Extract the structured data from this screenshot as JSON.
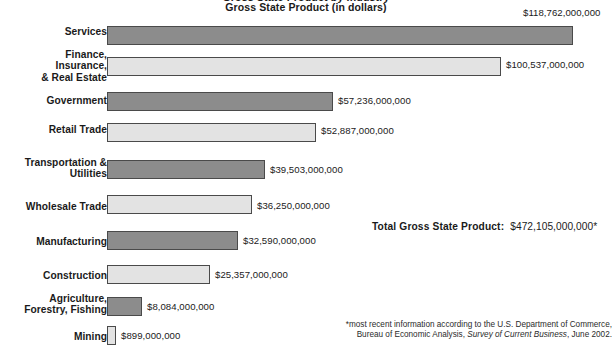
{
  "header": {
    "title_clipped": "Gross State Product by Industry",
    "subtitle": "Gross State Product (in dollars)"
  },
  "total": {
    "label": "Total Gross State Product:",
    "value": "$472,105,000,000*"
  },
  "footnote": {
    "line1": "*most recent information according to the U.S. Department of Commerce,",
    "line2_pre": "Bureau of Economic Analysis, ",
    "line2_ital": "Survey of Current Business",
    "line2_post": ", June 2002."
  },
  "chart_data": {
    "type": "bar",
    "orientation": "horizontal",
    "title": "Gross State Product by Industry",
    "subtitle": "Gross State Product (in dollars)",
    "xlabel": "",
    "ylabel": "",
    "grid": false,
    "legend": "none",
    "xlim": [
      0,
      118762000000
    ],
    "categories": [
      "Services",
      "Finance, Insurance, & Real Estate",
      "Government",
      "Retail Trade",
      "Transportation & Utilities",
      "Wholesale Trade",
      "Manufacturing",
      "Construction",
      "Agriculture, Forestry, Fishing",
      "Mining"
    ],
    "values": [
      118762000000,
      100537000000,
      57236000000,
      52887000000,
      39503000000,
      36250000000,
      32590000000,
      25357000000,
      8084000000,
      899000000
    ],
    "value_labels": [
      "$118,762,000,000",
      "$100,537,000,000",
      "$57,236,000,000",
      "$52,887,000,000",
      "$39,503,000,000",
      "$36,250,000,000",
      "$32,590,000,000",
      "$25,357,000,000",
      "$8,084,000,000",
      "$899,000,000"
    ],
    "bar_colors": [
      "#8c8c8c",
      "#e3e3e3",
      "#8c8c8c",
      "#e3e3e3",
      "#8c8c8c",
      "#e3e3e3",
      "#8c8c8c",
      "#e3e3e3",
      "#8c8c8c",
      "#e3e3e3"
    ],
    "total_label": "Total Gross State Product:",
    "total_value": "$472,105,000,000*",
    "annotations": [
      "*most recent information according to the U.S. Department of Commerce, Bureau of Economic Analysis, Survey of Current Business, June 2002."
    ]
  },
  "rows": [
    {
      "label": "Services",
      "label_top": 26,
      "bar_top": 26,
      "bar_h": 19,
      "bar_w": 466,
      "value_top": 7,
      "value_left": 523,
      "shade": "dark"
    },
    {
      "label": "Finance,\nInsurance,\n& Real Estate",
      "label_top": 49,
      "bar_top": 57,
      "bar_h": 19,
      "bar_w": 394,
      "value_top": 59,
      "value_left": 506,
      "shade": "light"
    },
    {
      "label": "Government",
      "label_top": 95,
      "bar_top": 92,
      "bar_h": 19,
      "bar_w": 226,
      "value_top": 95,
      "value_left": 338,
      "shade": "dark"
    },
    {
      "label": "Retail Trade",
      "label_top": 124,
      "bar_top": 123,
      "bar_h": 19,
      "bar_w": 209,
      "value_top": 125,
      "value_left": 321,
      "shade": "light"
    },
    {
      "label": "Transportation &\nUtilities",
      "label_top": 157,
      "bar_top": 160,
      "bar_h": 19,
      "bar_w": 158,
      "value_top": 164,
      "value_left": 270,
      "shade": "dark"
    },
    {
      "label": "Wholesale Trade",
      "label_top": 201,
      "bar_top": 195,
      "bar_h": 19,
      "bar_w": 145,
      "value_top": 200,
      "value_left": 257,
      "shade": "light"
    },
    {
      "label": "Manufacturing",
      "label_top": 236,
      "bar_top": 231,
      "bar_h": 19,
      "bar_w": 131,
      "value_top": 235,
      "value_left": 243,
      "shade": "dark"
    },
    {
      "label": "Construction",
      "label_top": 270,
      "bar_top": 265,
      "bar_h": 19,
      "bar_w": 103,
      "value_top": 269,
      "value_left": 215,
      "shade": "light"
    },
    {
      "label": "Agriculture,\nForestry, Fishing",
      "label_top": 293,
      "bar_top": 297,
      "bar_h": 19,
      "bar_w": 35,
      "value_top": 301,
      "value_left": 147,
      "shade": "dark"
    },
    {
      "label": "Mining",
      "label_top": 331,
      "bar_top": 326,
      "bar_h": 19,
      "bar_w": 9,
      "value_top": 330,
      "value_left": 121,
      "shade": "light"
    }
  ]
}
